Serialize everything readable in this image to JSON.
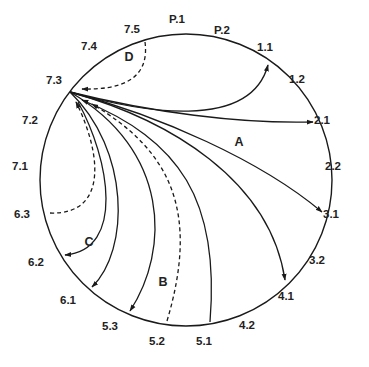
{
  "diagram": {
    "circle": {
      "cx": 186,
      "cy": 180,
      "r": 146
    },
    "source_node": "7.3",
    "nodes": [
      {
        "id": "P.1",
        "label": "P.1",
        "x": 177,
        "y": 23
      },
      {
        "id": "P.2",
        "label": "P.2",
        "x": 222,
        "y": 34
      },
      {
        "id": "1.1",
        "label": "1.1",
        "x": 265,
        "y": 51
      },
      {
        "id": "1.2",
        "label": "1.2",
        "x": 297,
        "y": 83
      },
      {
        "id": "2.1",
        "label": "2.1",
        "x": 322,
        "y": 124
      },
      {
        "id": "2.2",
        "label": "2.2",
        "x": 333,
        "y": 170
      },
      {
        "id": "3.1",
        "label": "3.1",
        "x": 331,
        "y": 218
      },
      {
        "id": "3.2",
        "label": "3.2",
        "x": 317,
        "y": 264
      },
      {
        "id": "4.1",
        "label": "4.1",
        "x": 286,
        "y": 300
      },
      {
        "id": "4.2",
        "label": "4.2",
        "x": 247,
        "y": 329
      },
      {
        "id": "5.1",
        "label": "5.1",
        "x": 204,
        "y": 345
      },
      {
        "id": "5.2",
        "label": "5.2",
        "x": 157,
        "y": 345
      },
      {
        "id": "5.3",
        "label": "5.3",
        "x": 110,
        "y": 330
      },
      {
        "id": "6.1",
        "label": "6.1",
        "x": 68,
        "y": 304
      },
      {
        "id": "6.2",
        "label": "6.2",
        "x": 36,
        "y": 266
      },
      {
        "id": "6.3",
        "label": "6.3",
        "x": 22,
        "y": 218
      },
      {
        "id": "7.1",
        "label": "7.1",
        "x": 20,
        "y": 170
      },
      {
        "id": "7.2",
        "label": "7.2",
        "x": 30,
        "y": 124
      },
      {
        "id": "7.3",
        "label": "7.3",
        "x": 54,
        "y": 84
      },
      {
        "id": "7.4",
        "label": "7.4",
        "x": 89,
        "y": 50
      },
      {
        "id": "7.5",
        "label": "7.5",
        "x": 132,
        "y": 33
      }
    ],
    "region_labels": [
      {
        "id": "A",
        "label": "A",
        "x": 239,
        "y": 146
      },
      {
        "id": "B",
        "label": "B",
        "x": 163,
        "y": 286
      },
      {
        "id": "C",
        "label": "C",
        "x": 89,
        "y": 246
      },
      {
        "id": "D",
        "label": "D",
        "x": 129,
        "y": 61
      }
    ],
    "edges": [
      {
        "from": "7.3",
        "to": "1.1",
        "style": "solid",
        "path": "M70,92 C140,112 250,132 268,65"
      },
      {
        "from": "7.3",
        "to": "2.1",
        "style": "solid",
        "path": "M70,92 C150,112 240,124 313,122"
      },
      {
        "from": "7.3",
        "to": "3.1",
        "style": "solid",
        "path": "M70,92 C160,116 260,160 322,212"
      },
      {
        "from": "7.3",
        "to": "4.1",
        "style": "solid",
        "path": "M70,92 C170,120 270,180 285,280"
      },
      {
        "from": "5.1",
        "to": "7.3",
        "style": "solid",
        "path": "M210,322 C220,200 180,140 82,100"
      },
      {
        "from": "5.2",
        "to": "7.3",
        "style": "dashed",
        "path": "M167,321 C200,210 170,150 92,104"
      },
      {
        "from": "7.3",
        "to": "5.3",
        "style": "solid",
        "path": "M70,92 C170,150 170,250 130,311"
      },
      {
        "from": "7.3",
        "to": "6.1",
        "style": "solid",
        "path": "M70,92 C130,150 130,250 92,287"
      },
      {
        "from": "7.3",
        "to": "6.2",
        "style": "solid",
        "path": "M78,102 C110,160 125,250 65,255"
      },
      {
        "from": "6.3",
        "to": "7.3",
        "style": "dashed",
        "path": "M50,213 C110,215 100,150 76,102"
      },
      {
        "from": "7.5",
        "to": "7.3",
        "style": "dashed",
        "path": "M145,42 C150,80 120,90 82,89"
      }
    ],
    "arrow_color": "#1a1a1a",
    "background": "#ffffff"
  }
}
